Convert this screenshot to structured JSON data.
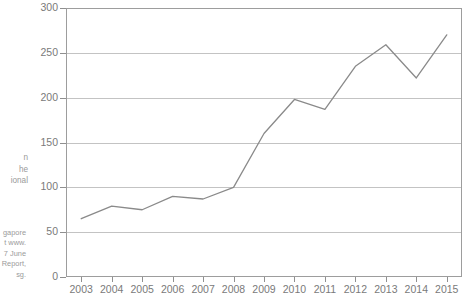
{
  "gutter": {
    "caption_lines": [
      "n",
      "he",
      "ional"
    ],
    "source_lines": [
      "gapore",
      "t www.",
      "7 June",
      "Report,",
      "sg."
    ]
  },
  "chart_data": {
    "type": "line",
    "title": "",
    "xlabel": "",
    "ylabel": "",
    "categories": [
      "2003",
      "2004",
      "2005",
      "2006",
      "2007",
      "2008",
      "2009",
      "2010",
      "2011",
      "2012",
      "2013",
      "2014",
      "2015"
    ],
    "values": [
      65,
      79,
      75,
      90,
      87,
      100,
      160,
      198,
      187,
      235,
      259,
      222,
      270
    ],
    "ylim": [
      0,
      300
    ],
    "ytick_labels": [
      "0",
      "50",
      "100",
      "150",
      "200",
      "250",
      "300"
    ],
    "ytick_values": [
      0,
      50,
      100,
      150,
      200,
      250,
      300
    ],
    "grid": true,
    "legend": "none",
    "line_color": "#8a8a8a",
    "grid_color": "#c3c3c3",
    "axis_color": "#9d9d9d",
    "tick_text_color": "#7a7a7a"
  }
}
